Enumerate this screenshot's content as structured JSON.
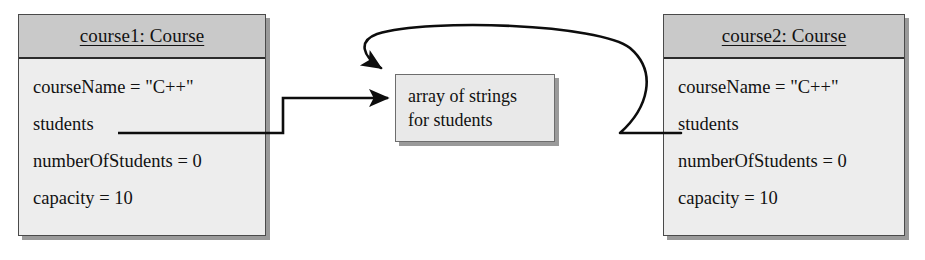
{
  "diagram": {
    "objects": [
      {
        "id": "course1",
        "title": "course1: Course",
        "attributes": [
          "courseName = \"C++\"",
          "students",
          "numberOfStudents = 0",
          "capacity = 10"
        ]
      },
      {
        "id": "course2",
        "title": "course2: Course",
        "attributes": [
          "courseName = \"C++\"",
          "students",
          "numberOfStudents = 0",
          "capacity = 10"
        ]
      }
    ],
    "note": {
      "id": "array-note",
      "lines": [
        "array of strings",
        "for students"
      ]
    },
    "connectors": [
      {
        "id": "course1-students-to-array",
        "from": "course1.students",
        "to": "array-note",
        "style": "orthogonal",
        "arrowhead": "filled-triangle"
      },
      {
        "id": "course2-students-to-array",
        "from": "course2.students",
        "to": "array-note",
        "style": "curved",
        "arrowhead": "filled-triangle"
      }
    ],
    "colors": {
      "header_fill": "#c9c9c9",
      "body_fill": "#ededed",
      "note_fill": "#e9e9e9",
      "border": "#4a4a4a",
      "shadow": "#9a9a9a",
      "line": "#0d0d0d",
      "text": "#111111",
      "background": "#ffffff"
    }
  }
}
